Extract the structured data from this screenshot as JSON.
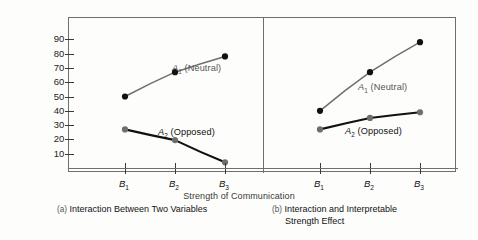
{
  "figure": {
    "ylabel_line1": "Mean Degree of Acceptance",
    "ylabel_line2": "of Proposed Position",
    "xlabel": "Strength of Communication"
  },
  "captions": {
    "a_tag": "(a)",
    "a_text": "Interaction Between Two Variables",
    "b_tag": "(b)",
    "b_text_line1": "Interaction and Interpretable",
    "b_text_line2": "Strength Effect"
  },
  "series_labels": {
    "neutral_base": "A",
    "neutral_sub": "1",
    "neutral_rest": " (Neutral)",
    "opposed_base": "A",
    "opposed_sub": "2",
    "opposed_rest": " (Opposed)"
  },
  "chart_data": [
    {
      "type": "line",
      "panel": "a",
      "title": "(a) Interaction Between Two Variables",
      "xlabel": "Strength of Communication",
      "ylabel": "Mean Degree of Acceptance of Proposed Position",
      "categories": [
        "B1",
        "B2",
        "B3"
      ],
      "tick_labels": [
        "B₁",
        "B₂",
        "B₃"
      ],
      "yticks": [
        10,
        20,
        30,
        40,
        50,
        60,
        70,
        80,
        90
      ],
      "ylim": [
        0,
        95
      ],
      "grid": false,
      "legend": "inline-annotation",
      "series": [
        {
          "name": "A1 (Neutral)",
          "values": [
            50,
            67,
            78
          ],
          "line_color": "#6e6e6e",
          "marker_color": "#111111"
        },
        {
          "name": "A2 (Opposed)",
          "values": [
            27,
            19.5,
            4
          ],
          "line_color": "#111111",
          "marker_color": "#6e6e6e"
        }
      ]
    },
    {
      "type": "line",
      "panel": "b",
      "title": "(b) Interaction and Interpretable Strength Effect",
      "xlabel": "Strength of Communication",
      "ylabel": "Mean Degree of Acceptance of Proposed Position",
      "categories": [
        "B1",
        "B2",
        "B3"
      ],
      "tick_labels": [
        "B₁",
        "B₂",
        "B₃"
      ],
      "yticks": [
        10,
        20,
        30,
        40,
        50,
        60,
        70,
        80,
        90
      ],
      "ylim": [
        0,
        95
      ],
      "grid": false,
      "legend": "inline-annotation",
      "series": [
        {
          "name": "A1 (Neutral)",
          "values": [
            40,
            67,
            88
          ],
          "line_color": "#6e6e6e",
          "marker_color": "#111111"
        },
        {
          "name": "A2 (Opposed)",
          "values": [
            27,
            35,
            39
          ],
          "line_color": "#111111",
          "marker_color": "#6e6e6e"
        }
      ]
    }
  ],
  "colors": {
    "frame": "#6f6f6f",
    "neutral_line": "#6e6e6e",
    "opposed_line": "#111111",
    "background": "#fdfdfc"
  }
}
